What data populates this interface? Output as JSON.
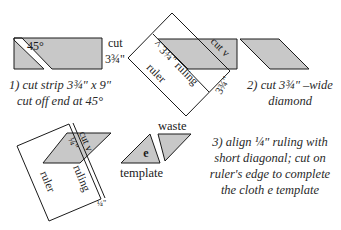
{
  "diagram": {
    "colors": {
      "fill": "#c8c8c8",
      "stroke": "#1a1a1a",
      "background": "#ffffff"
    },
    "step1": {
      "angle_label": "45°",
      "cut_label": "cut",
      "width_label": "3¾\"",
      "caption_line1": "1) cut strip 3¾\" x 9\"",
      "caption_line2": "cut off end at 45°"
    },
    "step2": {
      "ruler_ruling_label": "^ 3¾\" ruling",
      "ruler_label": "ruler",
      "cut_label": "cut v",
      "width_label": "3¾\"",
      "caption_line1": "2) cut 3¾\" –wide",
      "caption_line2": "diamond"
    },
    "step3": {
      "cut_label": "cut v",
      "quarter_label": "¼\"",
      "ruling_label": "ruling",
      "ruler_label": "ruler",
      "edge_label": "¼\"",
      "template_letter": "e",
      "template_label": "template",
      "waste_label": "waste",
      "caption_line1": "3) align ¼\" ruling with",
      "caption_line2": "short diagonal; cut on",
      "caption_line3": "ruler's edge to complete",
      "caption_line4": "the cloth e template"
    }
  }
}
